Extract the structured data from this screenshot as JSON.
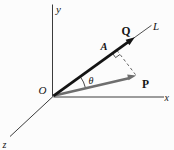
{
  "figure": {
    "labels": {
      "y_axis": "y",
      "x_axis": "x",
      "z_axis": "z",
      "origin": "O",
      "line": "L",
      "point_a": "A",
      "vector_q": "Q",
      "vector_p": "P",
      "angle_theta": "θ"
    },
    "colors": {
      "vector_q": "#141414",
      "vector_p": "#6e6e6e",
      "axis": "#3c3c3c",
      "line_l": "#3c3c3c",
      "dashed": "#555555",
      "marker": "#444444",
      "arc": "#333333",
      "background": "#fcfcfc"
    }
  }
}
